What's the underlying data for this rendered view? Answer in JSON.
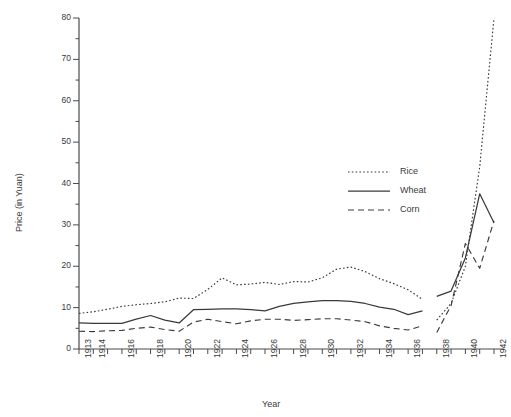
{
  "chart_data": {
    "type": "line",
    "title": "",
    "xlabel": "Year",
    "ylabel": "Price (in Yuan)",
    "xlim": [
      1913,
      1942.6
    ],
    "ylim": [
      0,
      80
    ],
    "yticks": [
      0,
      10,
      20,
      30,
      40,
      50,
      60,
      70,
      80
    ],
    "yticks_minor_step": 5,
    "xticks": [
      1913,
      1914,
      1915,
      1916,
      1917,
      1918,
      1919,
      1920,
      1921,
      1922,
      1923,
      1924,
      1925,
      1926,
      1927,
      1928,
      1929,
      1930,
      1931,
      1932,
      1933,
      1934,
      1935,
      1936,
      1937,
      1938,
      1939,
      1940,
      1941,
      1942
    ],
    "xtick_labels": [
      "1913",
      "1914",
      "",
      "1916",
      "",
      "1918",
      "",
      "1920",
      "",
      "1922",
      "",
      "1924",
      "",
      "1926",
      "",
      "1928",
      "",
      "1930",
      "",
      "1932",
      "",
      "1934",
      "",
      "1936",
      "",
      "1938",
      "",
      "1940",
      "",
      "1942"
    ],
    "grid": false,
    "legend_position": "center-right",
    "series": [
      {
        "name": "Rice",
        "style": "dotted",
        "color": "#3a3a3a",
        "x": [
          1913,
          1914,
          1915,
          1916,
          1917,
          1918,
          1919,
          1920,
          1921,
          1922,
          1923,
          1924,
          1925,
          1926,
          1927,
          1928,
          1929,
          1930,
          1931,
          1932,
          1933,
          1934,
          1935,
          1936,
          1937
        ],
        "values": [
          8.6,
          9.0,
          9.6,
          10.3,
          10.7,
          11.0,
          11.4,
          12.3,
          12.2,
          14.4,
          17.2,
          15.5,
          15.7,
          16.1,
          15.6,
          16.3,
          16.2,
          17.2,
          19.3,
          19.8,
          18.7,
          17.0,
          15.8,
          14.3,
          12.0
        ]
      },
      {
        "name": "Rice",
        "style": "dotted",
        "color": "#3a3a3a",
        "segment": "wartime",
        "x": [
          1938,
          1939,
          1940,
          1941,
          1942
        ],
        "values": [
          7.0,
          11.0,
          20.0,
          44.0,
          80.0
        ]
      },
      {
        "name": "Wheat",
        "style": "solid",
        "color": "#3a3a3a",
        "x": [
          1913,
          1914,
          1915,
          1916,
          1917,
          1918,
          1919,
          1920,
          1921,
          1922,
          1923,
          1924,
          1925,
          1926,
          1927,
          1928,
          1929,
          1930,
          1931,
          1932,
          1933,
          1934,
          1935,
          1936,
          1937
        ],
        "values": [
          6.3,
          6.2,
          6.2,
          6.2,
          7.2,
          8.1,
          7.0,
          6.3,
          9.5,
          9.6,
          9.7,
          9.7,
          9.5,
          9.2,
          10.3,
          11.0,
          11.4,
          11.7,
          11.7,
          11.5,
          11.0,
          10.1,
          9.6,
          8.3,
          9.2
        ]
      },
      {
        "name": "Wheat",
        "style": "solid",
        "color": "#3a3a3a",
        "segment": "wartime",
        "x": [
          1938,
          1939,
          1940,
          1941,
          1942
        ],
        "values": [
          12.7,
          14.0,
          22.0,
          37.5,
          30.5
        ]
      },
      {
        "name": "Corn",
        "style": "dashed",
        "color": "#3a3a3a",
        "x": [
          1913,
          1914,
          1915,
          1916,
          1917,
          1918,
          1919,
          1920,
          1921,
          1922,
          1923,
          1924,
          1925,
          1926,
          1927,
          1928,
          1929,
          1930,
          1931,
          1932,
          1933,
          1934,
          1935,
          1936,
          1937
        ],
        "values": [
          4.3,
          4.2,
          4.4,
          4.5,
          5.0,
          5.3,
          4.7,
          4.3,
          6.5,
          7.2,
          6.6,
          6.1,
          6.8,
          7.2,
          7.2,
          6.9,
          7.1,
          7.3,
          7.3,
          7.0,
          6.6,
          5.6,
          5.0,
          4.6,
          5.6
        ]
      },
      {
        "name": "Corn",
        "style": "dashed",
        "color": "#3a3a3a",
        "segment": "wartime",
        "x": [
          1938,
          1939,
          1940,
          1941,
          1942
        ],
        "values": [
          4.0,
          10.5,
          25.5,
          19.5,
          31.0
        ]
      }
    ],
    "legend_entries": [
      {
        "label": "Rice",
        "style": "dotted"
      },
      {
        "label": "Wheat",
        "style": "solid"
      },
      {
        "label": "Corn",
        "style": "dashed"
      }
    ]
  }
}
